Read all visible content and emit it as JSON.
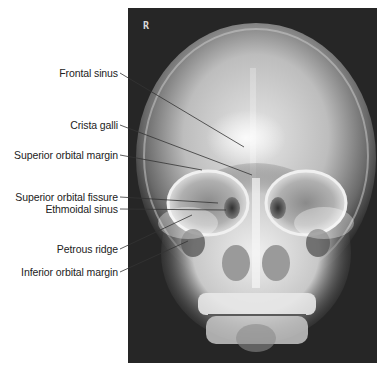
{
  "figure": {
    "type": "radiograph",
    "view": "PA skull (Caldwell projection)",
    "side_marker": "R",
    "colors": {
      "background": "#ffffff",
      "film_dark": "#262626",
      "bone_bright": "#f2f2f2",
      "label_text": "#222222",
      "leader_line": "#333333"
    }
  },
  "labels": [
    {
      "id": "frontal-sinus",
      "text": "Frontal sinus",
      "y": 73,
      "line": {
        "x1": 120,
        "y1": 73,
        "x2": 244,
        "y2": 147
      }
    },
    {
      "id": "crista-galli",
      "text": "Crista galli",
      "y": 125,
      "line": {
        "x1": 120,
        "y1": 125,
        "x2": 252,
        "y2": 175
      }
    },
    {
      "id": "superior-orbital-margin",
      "text": "Superior orbital margin",
      "y": 155,
      "line": {
        "x1": 120,
        "y1": 155,
        "x2": 202,
        "y2": 170
      }
    },
    {
      "id": "superior-orbital-fissure",
      "text": "Superior orbital fissure",
      "y": 197,
      "line": {
        "x1": 120,
        "y1": 197,
        "x2": 218,
        "y2": 203
      }
    },
    {
      "id": "ethmoidal-sinus",
      "text": "Ethmoidal sinus",
      "y": 209,
      "line": {
        "x1": 120,
        "y1": 209,
        "x2": 226,
        "y2": 210
      }
    },
    {
      "id": "petrous-ridge",
      "text": "Petrous ridge",
      "y": 249,
      "line": {
        "x1": 120,
        "y1": 249,
        "x2": 192,
        "y2": 215
      }
    },
    {
      "id": "inferior-orbital-margin",
      "text": "Inferior orbital margin",
      "y": 272,
      "line": {
        "x1": 120,
        "y1": 272,
        "x2": 188,
        "y2": 241
      }
    }
  ]
}
